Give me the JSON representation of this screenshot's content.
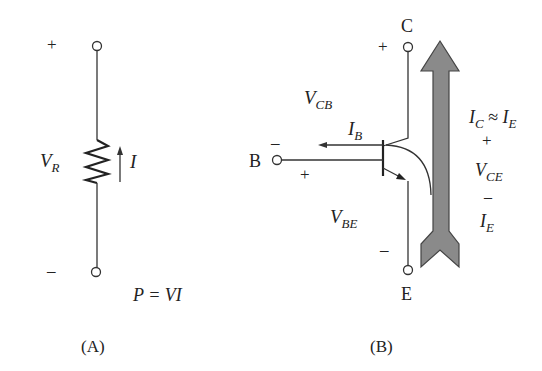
{
  "panel_a": {
    "caption": "(A)",
    "plus": "+",
    "minus": "–",
    "voltage_label": "V",
    "voltage_sub": "R",
    "current_label": "I",
    "power_eq": "P = VI"
  },
  "panel_b": {
    "caption": "(B)",
    "collector_label": "C",
    "base_label": "B",
    "emitter_label": "E",
    "vcb_label": "V",
    "vcb_sub": "CB",
    "ib_label": "I",
    "ib_sub": "B",
    "vbe_label": "V",
    "vbe_sub": "BE",
    "ic_label": "I",
    "ic_sub": "C",
    "approx": " ≈ ",
    "ie_label": "I",
    "ie_sub": "E",
    "vce_label": "V",
    "vce_sub": "CE",
    "ie2_label": "I",
    "ie2_sub": "E",
    "plus": "+",
    "minus": "–",
    "arrow_color": "#8a8a8a"
  }
}
